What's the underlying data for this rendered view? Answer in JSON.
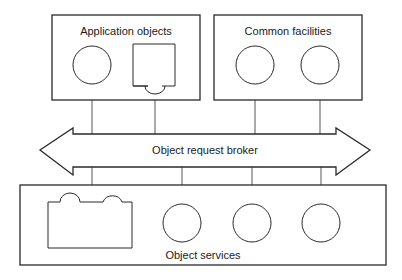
{
  "diagram": {
    "colors": {
      "line": "#2a2a2a",
      "background": "#ffffff",
      "text": "#1a1a1a"
    },
    "groups": {
      "application_objects": {
        "label": "Application objects"
      },
      "common_facilities": {
        "label": "Common facilities"
      },
      "object_services": {
        "label": "Object services"
      }
    },
    "broker": {
      "label": "Object request broker"
    }
  }
}
